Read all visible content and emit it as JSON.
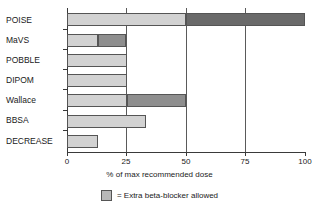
{
  "chart_data": {
    "type": "bar",
    "orientation": "horizontal",
    "title": "",
    "xlabel": "% of max recommended dose",
    "ylabel": "",
    "xlim": [
      0,
      100
    ],
    "xticks": [
      "0",
      "25",
      "50",
      "75",
      "100"
    ],
    "gridlines": [
      "25",
      "50",
      "75"
    ],
    "grid": true,
    "legend_position": "bottom-center",
    "categories": [
      "POISE",
      "MaVS",
      "POBBLE",
      "DIPOM",
      "Wallace",
      "BBSA",
      "DECREASE"
    ],
    "series": [
      {
        "name": "Dose given",
        "color": "#d2d2d2",
        "values": [
          50,
          13,
          25,
          25,
          25,
          33,
          13
        ]
      },
      {
        "name": "Extra beta-blocker allowed",
        "color": "#8e8e8e",
        "values": [
          50,
          12,
          0,
          0,
          25,
          0,
          0
        ]
      }
    ],
    "totals": [
      100,
      25,
      25,
      25,
      50,
      33,
      13
    ],
    "legend": [
      {
        "label": "= Extra beta-blocker allowed",
        "color": "#b8b8b8"
      }
    ]
  },
  "axis": {
    "x_title": "% of max recommended dose",
    "ticks": [
      {
        "value": "0",
        "label": "0"
      },
      {
        "value": "25",
        "label": "25"
      },
      {
        "value": "50",
        "label": "50"
      },
      {
        "value": "75",
        "label": "75"
      },
      {
        "value": "100",
        "label": "100"
      }
    ]
  },
  "categories": [
    {
      "label": "POISE"
    },
    {
      "label": "MaVS"
    },
    {
      "label": "POBBLE"
    },
    {
      "label": "DIPOM"
    },
    {
      "label": "Wallace"
    },
    {
      "label": "BBSA"
    },
    {
      "label": "DECREASE"
    }
  ],
  "legend": {
    "swatch_color": "#b8b8b8",
    "text": "= Extra beta-blocker allowed"
  },
  "colors": {
    "base": "#d2d2d2",
    "extra": "#8e8e8e",
    "extra_dark": "#6a6a6a",
    "axis": "#3a3a3a",
    "background": "#ffffff"
  }
}
